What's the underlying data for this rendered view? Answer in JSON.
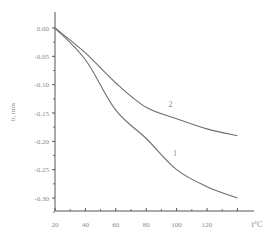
{
  "chart_data": {
    "type": "line",
    "title": "",
    "xlabel": "t°C",
    "ylabel": "h, mm",
    "xlim": [
      20,
      140
    ],
    "ylim": [
      -0.3,
      0.0
    ],
    "x_ticks": [
      20,
      40,
      60,
      80,
      100,
      120
    ],
    "x_tick_labels": [
      "20",
      "40",
      "60",
      "80",
      "100",
      "120"
    ],
    "y_ticks": [
      0.0,
      -0.05,
      -0.1,
      -0.15,
      -0.2,
      -0.25,
      -0.3
    ],
    "y_tick_labels": [
      "0.00",
      "-0.05",
      "-0.10",
      "-0.15",
      "-0.20",
      "-0.25",
      "-0.30"
    ],
    "grid": false,
    "legend": "inline curve labels",
    "x": [
      20,
      40,
      60,
      80,
      100,
      120,
      140
    ],
    "series": [
      {
        "name": "1",
        "values": [
          0.0,
          -0.056,
          -0.145,
          -0.195,
          -0.25,
          -0.28,
          -0.3
        ]
      },
      {
        "name": "2",
        "values": [
          0.0,
          -0.044,
          -0.097,
          -0.14,
          -0.16,
          -0.178,
          -0.19
        ]
      }
    ],
    "annotations": [
      {
        "text": "1",
        "x": 99,
        "y": -0.225
      },
      {
        "text": "2",
        "x": 96,
        "y": -0.14
      }
    ]
  }
}
